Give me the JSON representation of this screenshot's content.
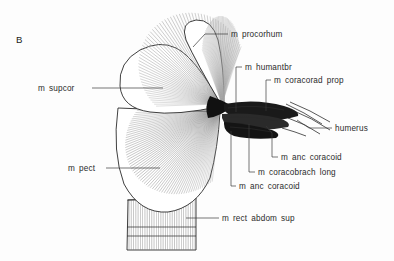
{
  "figure": {
    "panel_label": "B",
    "type": "anatomical-line-drawing",
    "background_color": "#fdfdfd",
    "ink_color": "#1d1d1d",
    "label_color": "#2b2b2b"
  },
  "labels": [
    {
      "id": "m-procorhum",
      "text": "m procorhum",
      "text_x": 231,
      "text_y": 37,
      "anchor": "start",
      "leader": "M 228 34 L 205 34 L 193 47",
      "target_x": 193,
      "target_y": 47
    },
    {
      "id": "m-supcor",
      "text": "m supcor",
      "text_x": 38,
      "text_y": 91,
      "anchor": "start",
      "leader": "M 92 88 L 163 88",
      "target_x": 163,
      "target_y": 88
    },
    {
      "id": "m-humantbr",
      "text": "m humantbr",
      "text_x": 245,
      "text_y": 70,
      "anchor": "start",
      "leader": "M 242 67 L 236 67 L 236 112",
      "target_x": 236,
      "target_y": 112
    },
    {
      "id": "m-coracorad-prop",
      "text": "m coracorad prop",
      "text_x": 274,
      "text_y": 83,
      "anchor": "start",
      "leader": "M 271 80 L 266 80 L 266 111",
      "target_x": 266,
      "target_y": 111
    },
    {
      "id": "humerus",
      "text": "humerus",
      "text_x": 335,
      "text_y": 131,
      "anchor": "start",
      "leader": "M 332 128 L 309 128 L 297 120",
      "target_x": 297,
      "target_y": 120
    },
    {
      "id": "m-anc-coracoid-upper",
      "text": "m anc coracoid",
      "text_x": 281,
      "text_y": 160,
      "anchor": "start",
      "leader": "M 278 157 L 272 157 L 272 133 L 266 126",
      "target_x": 266,
      "target_y": 126
    },
    {
      "id": "m-coracobrach-long",
      "text": "m coracobrach long",
      "text_x": 258,
      "text_y": 175,
      "anchor": "start",
      "leader": "M 255 172 L 249 172 L 249 124",
      "target_x": 249,
      "target_y": 124
    },
    {
      "id": "m-anc-coracoid-lower",
      "text": "m anc coracoid",
      "text_x": 239,
      "text_y": 189,
      "anchor": "start",
      "leader": "M 236 186 L 231 186 L 231 131",
      "target_x": 231,
      "target_y": 131
    },
    {
      "id": "m-pect",
      "text": "m pect",
      "text_x": 68,
      "text_y": 171,
      "anchor": "start",
      "leader": "M 106 168 L 160 168",
      "target_x": 160,
      "target_y": 168
    },
    {
      "id": "m-rect-abdom-sup",
      "text": "m rect abdom sup",
      "text_x": 222,
      "text_y": 221,
      "anchor": "start",
      "leader": "M 219 218 L 186 218",
      "target_x": 186,
      "target_y": 218
    }
  ],
  "anatomy": {
    "convergence_point": {
      "x": 222,
      "y": 106
    },
    "supracoracoideus_fan": {
      "rays": 64,
      "color": "#9a9a9a"
    },
    "pectoralis_fan": {
      "rays": 70,
      "color": "#8e8e8e"
    },
    "procorhum_fan": {
      "rays": 46,
      "color": "#a6a6a6"
    },
    "rectus_abdominis": {
      "striations": 30,
      "color": "#7d7d7d"
    },
    "humerus_mass": {
      "color": "#141414"
    },
    "bone_lines": 5
  }
}
